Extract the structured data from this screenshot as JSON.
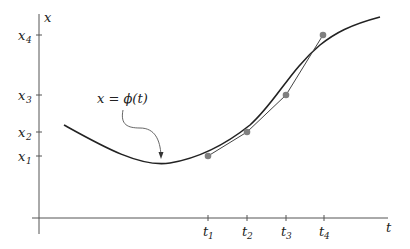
{
  "figure": {
    "axes": {
      "x_label": "t",
      "y_label": "x"
    },
    "y_ticks": [
      {
        "name": "x",
        "sub": "4"
      },
      {
        "name": "x",
        "sub": "3"
      },
      {
        "name": "x",
        "sub": "2"
      },
      {
        "name": "x",
        "sub": "1"
      }
    ],
    "x_ticks": [
      {
        "name": "t",
        "sub": "1"
      },
      {
        "name": "t",
        "sub": "2"
      },
      {
        "name": "t",
        "sub": "3"
      },
      {
        "name": "t",
        "sub": "4"
      }
    ],
    "annotation": "x = ϕ(t)",
    "colors": {
      "curve": "#222222",
      "points": "#808080",
      "axes": "#555555"
    }
  }
}
